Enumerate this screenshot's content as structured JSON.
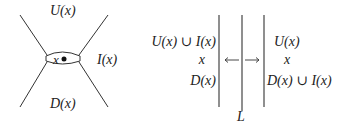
{
  "left_figure": {
    "label_top": "U(x)",
    "label_right": "I(x)",
    "label_bottom": "D(x)",
    "center_point_label": "x"
  },
  "right_figure": {
    "left_column": [
      "U(x) ∪ I(x)",
      "x",
      "D(x)"
    ],
    "right_column": [
      "U(x)",
      "x",
      "D(x) ∪ I(x)"
    ],
    "arrow_left": "←",
    "arrow_right": "→",
    "line_label": "L"
  },
  "colors": {
    "stroke": "#333333",
    "text": "#222222"
  }
}
